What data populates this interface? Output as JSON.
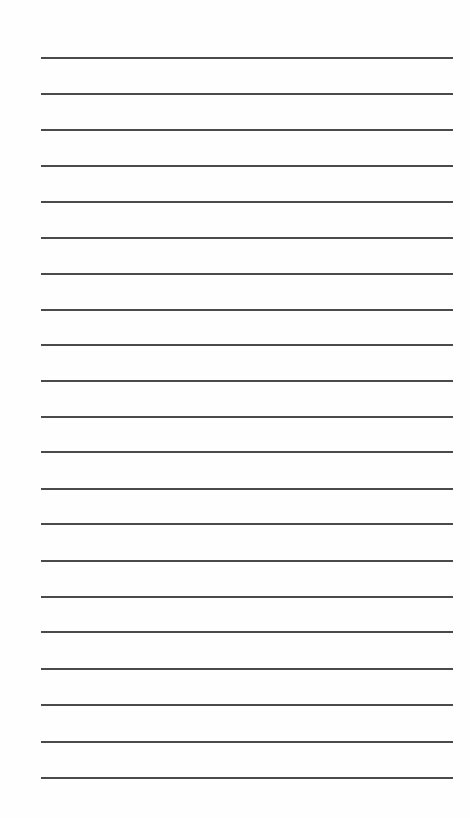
{
  "paper": {
    "type": "lined-paper",
    "background_color": "#fefefe",
    "line_color": "#4a4a4a",
    "line_count": 21,
    "line_left": 41,
    "line_width": 412,
    "line_positions": [
      58,
      94,
      130,
      166,
      202,
      238,
      274,
      310,
      345,
      381,
      417,
      452,
      489,
      524,
      561,
      597,
      632,
      669,
      705,
      742,
      778
    ]
  }
}
